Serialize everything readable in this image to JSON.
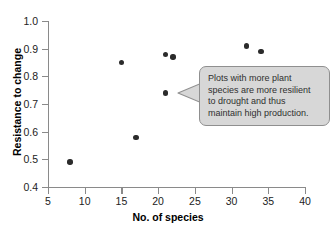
{
  "chart_data": {
    "type": "scatter",
    "title": "",
    "xlabel": "No. of species",
    "ylabel": "Resistance to change",
    "xlim": [
      5,
      40
    ],
    "ylim": [
      0.4,
      1.0
    ],
    "xticks": [
      "5",
      "10",
      "15",
      "20",
      "25",
      "30",
      "35",
      "40"
    ],
    "yticks": [
      "1.0",
      "0.9",
      "0.8",
      "0.7",
      "0.6",
      "0.5",
      "0.4"
    ],
    "grid": false,
    "legend": "none",
    "x": [
      8,
      15,
      17,
      21,
      21,
      22,
      32,
      34
    ],
    "y": [
      0.49,
      0.85,
      0.58,
      0.88,
      0.74,
      0.87,
      0.91,
      0.89
    ],
    "points": [
      {
        "x": 8,
        "y": 0.49
      },
      {
        "x": 15,
        "y": 0.85
      },
      {
        "x": 17,
        "y": 0.58
      },
      {
        "x": 21,
        "y": 0.88
      },
      {
        "x": 21,
        "y": 0.74
      },
      {
        "x": 22,
        "y": 0.87
      },
      {
        "x": 32,
        "y": 0.91
      },
      {
        "x": 34,
        "y": 0.89
      }
    ],
    "marker_color": "#2b2b2b",
    "annotations": [
      {
        "text": "Plots with more plant species are more resilient to drought and thus maintain high production.",
        "style": "callout-bubble",
        "fill": "#d7d7d7",
        "border": "#8f8f8f",
        "points_to": "left"
      }
    ]
  },
  "callout": {
    "text": "Plots with more plant\nspecies are more resilient\nto drought and thus\nmaintain high production."
  }
}
